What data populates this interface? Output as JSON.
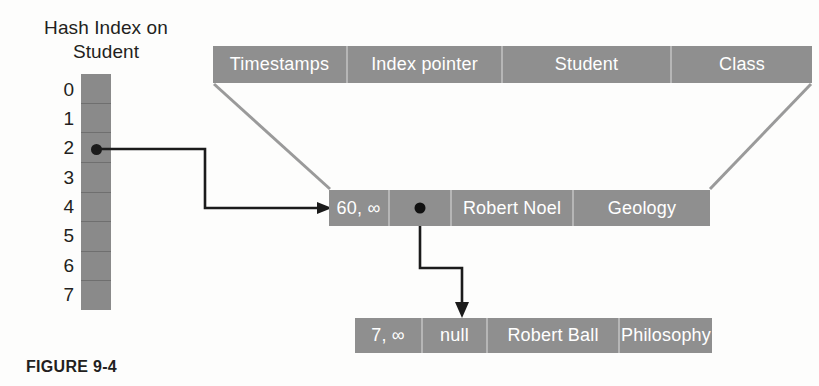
{
  "figure": {
    "caption": "FIGURE 9-4"
  },
  "index": {
    "title": "Hash Index on\nStudent",
    "title_line1": "Hash Index on",
    "title_line2": "Student",
    "slots": [
      "0",
      "1",
      "2",
      "3",
      "4",
      "5",
      "6",
      "7"
    ],
    "pointer_slot": "2",
    "pointer_icon": "filled-dot-icon"
  },
  "table": {
    "headers": [
      "Timestamps",
      "Index pointer",
      "Student",
      "Class"
    ],
    "rows": [
      {
        "timestamps": "60, ∞",
        "index_pointer": "",
        "index_pointer_icon": "filled-dot-icon",
        "student": "Robert Noel",
        "class": "Geology"
      },
      {
        "timestamps": "7, ∞",
        "index_pointer": "null",
        "index_pointer_icon": "none",
        "student": "Robert Ball",
        "class": "Philosophy"
      }
    ]
  },
  "connectors": {
    "index_to_record_arrow": "arrow-from-hash-slot-2-to-record-1",
    "record_to_record_arrow": "arrow-from-record-1-pointer-to-record-2",
    "header_left_guide": "diagonal-guide-left",
    "header_right_guide": "diagonal-guide-right"
  },
  "colors": {
    "cell_fill": "#8f8f8f",
    "index_fill": "#8a8a8a",
    "cell_text": "#ffffff",
    "divider": "#b6b6b6",
    "arrow": "#1b1b1b",
    "guide": "#9a9a9a",
    "label_text": "#231f20",
    "background": "#fdfdfc"
  }
}
